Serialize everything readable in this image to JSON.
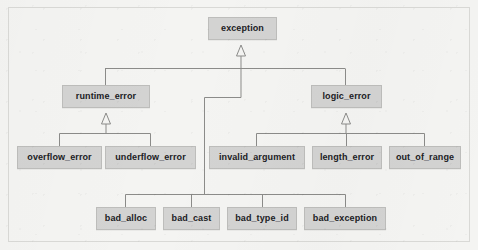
{
  "diagram": {
    "type": "uml-class-hierarchy",
    "relationship": "generalization",
    "background_color": "#f4f4f2",
    "node_fill_color": "#d3d3d2",
    "node_border_color": "#bdbdbb",
    "edge_color": "#8b8b89",
    "text_color": "#20201f",
    "nodes": [
      {
        "id": "exception",
        "label": "exception",
        "x": 208,
        "y": 17,
        "w": 69,
        "h": 23,
        "level": 0
      },
      {
        "id": "runtime_error",
        "label": "runtime_error",
        "x": 62,
        "y": 85,
        "w": 88,
        "h": 23,
        "level": 1
      },
      {
        "id": "logic_error",
        "label": "logic_error",
        "x": 311,
        "y": 85,
        "w": 71,
        "h": 23,
        "level": 1
      },
      {
        "id": "overflow_error",
        "label": "overflow_error",
        "x": 17,
        "y": 146,
        "w": 85,
        "h": 23,
        "level": 2
      },
      {
        "id": "underflow_error",
        "label": "underflow_error",
        "x": 105,
        "y": 146,
        "w": 91,
        "h": 23,
        "level": 2
      },
      {
        "id": "invalid_argument",
        "label": "invalid_argument",
        "x": 209,
        "y": 146,
        "w": 96,
        "h": 23,
        "level": 2
      },
      {
        "id": "length_error",
        "label": "length_error",
        "x": 312,
        "y": 146,
        "w": 70,
        "h": 23,
        "level": 2
      },
      {
        "id": "out_of_range",
        "label": "out_of_range",
        "x": 389,
        "y": 146,
        "w": 72,
        "h": 23,
        "level": 2
      },
      {
        "id": "bad_alloc",
        "label": "bad_alloc",
        "x": 96,
        "y": 207,
        "w": 60,
        "h": 23,
        "level": 3
      },
      {
        "id": "bad_cast",
        "label": "bad_cast",
        "x": 163,
        "y": 207,
        "w": 57,
        "h": 23,
        "level": 3
      },
      {
        "id": "bad_type_id",
        "label": "bad_type_id",
        "x": 227,
        "y": 207,
        "w": 70,
        "h": 23,
        "level": 3
      },
      {
        "id": "bad_exception",
        "label": "bad_exception",
        "x": 304,
        "y": 207,
        "w": 82,
        "h": 23,
        "level": 3
      }
    ],
    "edges": [
      {
        "from": "runtime_error",
        "to": "exception"
      },
      {
        "from": "logic_error",
        "to": "exception"
      },
      {
        "from": "overflow_error",
        "to": "runtime_error"
      },
      {
        "from": "underflow_error",
        "to": "runtime_error"
      },
      {
        "from": "invalid_argument",
        "to": "logic_error"
      },
      {
        "from": "length_error",
        "to": "logic_error"
      },
      {
        "from": "out_of_range",
        "to": "logic_error"
      },
      {
        "from": "bad_alloc",
        "to": "exception"
      },
      {
        "from": "bad_cast",
        "to": "exception"
      },
      {
        "from": "bad_type_id",
        "to": "exception"
      },
      {
        "from": "bad_exception",
        "to": "exception"
      }
    ]
  }
}
